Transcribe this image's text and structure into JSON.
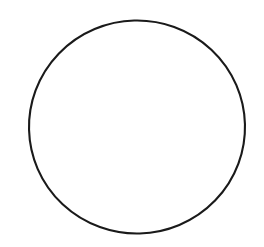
{
  "canvas": {
    "width": 264,
    "height": 247,
    "background_color": "#ffffff",
    "description": "Plain white canvas containing a single hand-drawn circle outline, no text or labels"
  },
  "figure": {
    "name": "circle-outline",
    "shape_type": "ellipse",
    "fill": "none",
    "stroke_color": "#1a1a1a",
    "stroke_width": 2.1,
    "center_x": 137,
    "center_y": 127,
    "radius_x": 108,
    "radius_y": 106.5,
    "bounds": {
      "left": 29,
      "right": 245,
      "top": 20.5,
      "bottom": 233.5
    },
    "rotation_deg": -1.5
  },
  "chart_data": {
    "type": "scatter",
    "title": "",
    "subtitle": "",
    "xlabel": "",
    "ylabel": "",
    "legend": [],
    "annotations": [],
    "grid": false,
    "series": [
      {
        "name": "circle-outline",
        "shape": "ellipse",
        "center": [
          137,
          127
        ],
        "radius_x": 108,
        "radius_y": 106.5,
        "stroke": "#1a1a1a",
        "fill": "none"
      }
    ]
  }
}
